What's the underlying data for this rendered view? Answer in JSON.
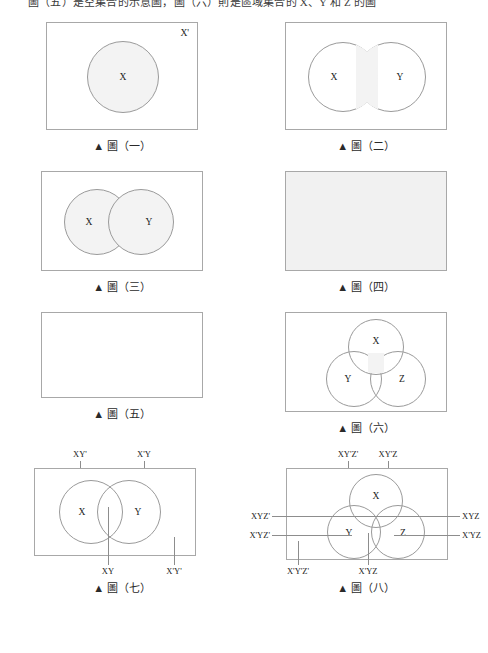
{
  "document": {
    "cut_header_text": "圖（五）是空集合的示意圖，圖（六）則是區域集合的 X、Y 和 Z 的圖",
    "caption_prefix": "▲",
    "caption_word": "圖"
  },
  "figures": [
    {
      "id": "fig-1",
      "caption": "▲ 圖（一）",
      "caption_number": "（一）",
      "description": "single shaded circle X inside rectangle with complement label",
      "set_labels": [
        "X"
      ],
      "corner_label": "X'",
      "shaded": "circle-x"
    },
    {
      "id": "fig-2",
      "caption": "▲ 圖（二）",
      "caption_number": "（二）",
      "description": "two overlapping circles, intersection shaded",
      "set_labels": [
        "X",
        "Y"
      ],
      "shaded": "intersection"
    },
    {
      "id": "fig-3",
      "caption": "▲ 圖（三）",
      "caption_number": "（三）",
      "description": "two overlapping circles, union shaded",
      "set_labels": [
        "X",
        "Y"
      ],
      "shaded": "union"
    },
    {
      "id": "fig-4",
      "caption": "▲ 圖（四）",
      "caption_number": "（四）",
      "description": "entire universal rectangle shaded",
      "set_labels": [],
      "shaded": "universe"
    },
    {
      "id": "fig-5",
      "caption": "▲ 圖（五）",
      "caption_number": "（五）",
      "description": "empty rectangle, nothing shaded",
      "set_labels": [],
      "shaded": "none"
    },
    {
      "id": "fig-6",
      "caption": "▲ 圖（六）",
      "caption_number": "（六）",
      "description": "three overlapping circles X Y Z, triple intersection shaded",
      "set_labels": [
        "X",
        "Y",
        "Z"
      ],
      "shaded": "triple-intersection"
    },
    {
      "id": "fig-7",
      "caption": "▲ 圖（七）",
      "caption_number": "（七）",
      "description": "two-set Venn diagram with four labelled regions",
      "set_labels": [
        "X",
        "Y"
      ],
      "region_tags": {
        "top_left": "XY'",
        "top_right": "X'Y",
        "bottom_center": "XY",
        "bottom_right": "X'Y'"
      }
    },
    {
      "id": "fig-8",
      "caption": "▲ 圖（八）",
      "caption_number": "（八）",
      "description": "three-set Venn diagram with eight labelled regions",
      "set_labels": [
        "X",
        "Y",
        "Z"
      ],
      "region_tags": {
        "top_left": "XY'Z'",
        "top_right": "XY'Z",
        "left_upper": "XYZ'",
        "left_lower": "X'YZ'",
        "right_upper": "XYZ",
        "right_lower": "X'YZ",
        "bottom_left": "X'Y'Z'",
        "bottom_center": "X'YZ"
      }
    }
  ],
  "colors": {
    "frame_stroke": "#a8a8a8",
    "circle_stroke": "#9a9a9a",
    "shade_fill": "#f3f3f3",
    "filled_rect": "#f1f1f1",
    "leader_line": "#8d8d8d",
    "text": "#1c1c1c"
  }
}
